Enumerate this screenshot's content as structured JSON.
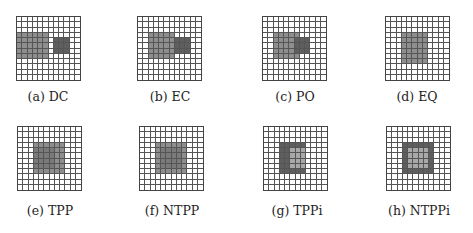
{
  "figure": {
    "grid_size": 12,
    "colors": {
      "light_region": "#8e8e8e",
      "dark_region": "#5e5e5e",
      "grid_line": "#555555",
      "background": "#ffffff"
    },
    "panels": [
      {
        "id": "a",
        "caption": "(a) DC",
        "relation": "DC",
        "regions": [
          {
            "shade": "L",
            "rows": [
              3,
              7
            ],
            "cols": [
              0,
              5
            ]
          },
          {
            "shade": "D",
            "rows": [
              4,
              6
            ],
            "cols": [
              7,
              9
            ]
          }
        ]
      },
      {
        "id": "b",
        "caption": "(b) EC",
        "relation": "EC",
        "regions": [
          {
            "shade": "L",
            "rows": [
              3,
              7
            ],
            "cols": [
              2,
              6
            ]
          },
          {
            "shade": "D",
            "rows": [
              4,
              6
            ],
            "cols": [
              7,
              9
            ]
          }
        ]
      },
      {
        "id": "c",
        "caption": "(c) PO",
        "relation": "PO",
        "regions": [
          {
            "shade": "L",
            "rows": [
              3,
              7
            ],
            "cols": [
              2,
              6
            ]
          },
          {
            "shade": "D",
            "rows": [
              4,
              6
            ],
            "cols": [
              6,
              8
            ]
          }
        ]
      },
      {
        "id": "d",
        "caption": "(d) EQ",
        "relation": "EQ",
        "regions": [
          {
            "shade": "L",
            "rows": [
              3,
              8
            ],
            "cols": [
              3,
              7
            ]
          }
        ]
      },
      {
        "id": "e",
        "caption": "(e) TPP",
        "relation": "TPP",
        "regions": [
          {
            "shade": "L",
            "rows": [
              3,
              8
            ],
            "cols": [
              3,
              8
            ]
          },
          {
            "shade": "M",
            "rows": [
              4,
              7
            ],
            "cols": [
              3,
              6
            ]
          }
        ]
      },
      {
        "id": "f",
        "caption": "(f) NTPP",
        "relation": "NTPP",
        "regions": [
          {
            "shade": "L",
            "rows": [
              3,
              8
            ],
            "cols": [
              3,
              8
            ]
          },
          {
            "shade": "M",
            "rows": [
              4,
              7
            ],
            "cols": [
              4,
              7
            ]
          }
        ]
      },
      {
        "id": "g",
        "caption": "(g) TPPi",
        "relation": "TPPi",
        "regions": [
          {
            "shade": "D",
            "rows": [
              3,
              8
            ],
            "cols": [
              3,
              7
            ]
          },
          {
            "shade": "P",
            "rows": [
              4,
              7
            ],
            "cols": [
              5,
              7
            ]
          }
        ]
      },
      {
        "id": "h",
        "caption": "(h) NTPPi",
        "relation": "NTPPi",
        "regions": [
          {
            "shade": "D",
            "rows": [
              3,
              8
            ],
            "cols": [
              3,
              8
            ]
          },
          {
            "shade": "P",
            "rows": [
              4,
              7
            ],
            "cols": [
              4,
              7
            ]
          }
        ]
      }
    ]
  }
}
